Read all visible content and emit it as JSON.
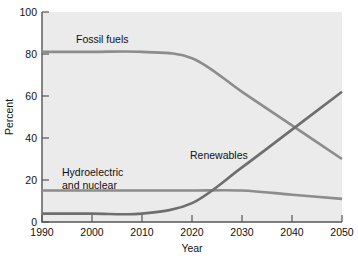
{
  "chart_data": {
    "type": "line",
    "title": "",
    "xlabel": "Year",
    "ylabel": "Percent",
    "xlim": [
      1990,
      2050
    ],
    "ylim": [
      0,
      100
    ],
    "xticks": [
      1990,
      2000,
      2010,
      2020,
      2030,
      2040,
      2050
    ],
    "yticks": [
      0,
      20,
      40,
      60,
      80,
      100
    ],
    "xtick_labels": [
      "1990",
      "2000",
      "2010",
      "2020",
      "2030",
      "2040",
      "2050"
    ],
    "ytick_labels": [
      "0",
      "20",
      "40",
      "60",
      "80",
      "100"
    ],
    "grid": false,
    "legend": "inline-labels",
    "x": [
      1990,
      2000,
      2010,
      2020,
      2030,
      2040,
      2050
    ],
    "series": [
      {
        "name": "Fossil fuels",
        "color": "#8c8c8c",
        "values": [
          81,
          81,
          81,
          78,
          62,
          46,
          30
        ],
        "label_x": 2005,
        "label_y": 88
      },
      {
        "name": "Hydroelectric and nuclear",
        "color": "#8c8c8c",
        "values": [
          15,
          15,
          15,
          15,
          15,
          13,
          11
        ],
        "label_line_1": "Hydroelectric",
        "label_line_2": "and nuclear",
        "label_x": 2004,
        "label_y": 24
      },
      {
        "name": "Renewables",
        "color": "#6e6e6e",
        "values": [
          4,
          4,
          4,
          9,
          26,
          44,
          62
        ],
        "label_x": 2027,
        "label_y": 35
      }
    ],
    "annotations": [
      {
        "text": "Fossil fuels",
        "series": "Fossil fuels"
      },
      {
        "text": "Hydroelectric",
        "series": "Hydroelectric and nuclear"
      },
      {
        "text": "and nuclear",
        "series": "Hydroelectric and nuclear"
      },
      {
        "text": "Renewables",
        "series": "Renewables"
      }
    ],
    "plot_background": "#ebebeb",
    "axis_color": "#555555"
  },
  "labels": {
    "fossil_fuels": "Fossil fuels",
    "hydro_line1": "Hydroelectric",
    "hydro_line2": "and nuclear",
    "renewables": "Renewables",
    "y_axis_title": "Percent",
    "x_axis_title": "Year",
    "ytick_0": "0",
    "ytick_20": "20",
    "ytick_40": "40",
    "ytick_60": "60",
    "ytick_80": "80",
    "ytick_100": "100",
    "xtick_1990": "1990",
    "xtick_2000": "2000",
    "xtick_2010": "2010",
    "xtick_2020": "2020",
    "xtick_2030": "2030",
    "xtick_2040": "2040",
    "xtick_2050": "2050"
  }
}
